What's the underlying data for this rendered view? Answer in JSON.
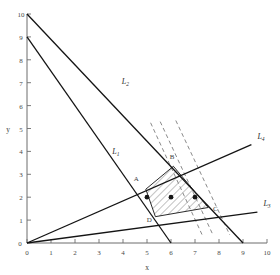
{
  "chart_data": {
    "type": "line",
    "title": "",
    "xlabel": "x",
    "ylabel": "y",
    "xlim": [
      0,
      10
    ],
    "ylim": [
      0,
      10
    ],
    "xticks": [
      0,
      1,
      2,
      3,
      4,
      5,
      6,
      7,
      8,
      9,
      10
    ],
    "yticks": [
      0,
      1,
      2,
      3,
      4,
      5,
      6,
      7,
      8,
      9,
      10
    ],
    "xticklabels": [
      "0",
      "1",
      "2",
      "3",
      "4",
      "5",
      "6",
      "7",
      "8",
      "9",
      "10"
    ],
    "yticklabels": [
      "0",
      "1",
      "2",
      "3",
      "4",
      "5",
      "6",
      "7",
      "8",
      "9",
      "10"
    ],
    "grid": false,
    "legend": "none",
    "series": [
      {
        "name": "L1",
        "label": "L",
        "sub": "1",
        "kind": "solid-constraint-line",
        "points": [
          [
            0,
            9
          ],
          [
            6,
            0
          ]
        ],
        "label_pos": [
          3.55,
          3.9
        ]
      },
      {
        "name": "L2",
        "label": "L",
        "sub": "2",
        "kind": "solid-constraint-line",
        "points": [
          [
            0,
            10
          ],
          [
            9,
            0
          ]
        ],
        "label_pos": [
          3.95,
          6.95
        ]
      },
      {
        "name": "L3",
        "label": "L",
        "sub": "3",
        "kind": "solid-constraint-line",
        "points": [
          [
            0,
            0
          ],
          [
            9.6,
            1.35
          ]
        ],
        "label_pos": [
          9.85,
          1.62
        ]
      },
      {
        "name": "L4",
        "label": "L",
        "sub": "4",
        "kind": "solid-constraint-line",
        "points": [
          [
            0,
            0
          ],
          [
            9.35,
            4.3
          ]
        ],
        "label_pos": [
          9.6,
          4.55
        ]
      }
    ],
    "dashed_objective_lines": [
      {
        "name": "objective-dashed-1",
        "points": [
          [
            5.15,
            5.25
          ],
          [
            7.3,
            0.35
          ]
        ]
      },
      {
        "name": "objective-dashed-2",
        "points": [
          [
            5.55,
            5.3
          ],
          [
            7.75,
            0.35
          ]
        ]
      },
      {
        "name": "objective-dashed-3",
        "points": [
          [
            6.2,
            5.35
          ],
          [
            8.45,
            0.35
          ]
        ]
      }
    ],
    "feasible_region": {
      "name": "feasible-region",
      "hatched": true,
      "vertices": [
        [
          4.95,
          2.35
        ],
        [
          6.1,
          3.35
        ],
        [
          7.55,
          1.55
        ],
        [
          5.35,
          1.15
        ]
      ],
      "vertex_labels": [
        "A",
        "B",
        "C",
        "D"
      ],
      "vertex_label_pos": [
        [
          4.55,
          2.7
        ],
        [
          6.05,
          3.65
        ],
        [
          7.85,
          1.4
        ],
        [
          5.1,
          0.92
        ]
      ]
    },
    "marked_points": [
      {
        "name": "lattice-point-1",
        "x": 5.0,
        "y": 2.0
      },
      {
        "name": "lattice-point-2",
        "x": 6.0,
        "y": 2.0
      },
      {
        "name": "lattice-point-3",
        "x": 7.0,
        "y": 2.0
      }
    ],
    "annotations": []
  },
  "colors": {
    "axis": "#6d6d6d",
    "line": "#141414",
    "dashed": "#8a8a8a",
    "hatch": "#555555",
    "text": "#3c3c3c",
    "background": "#ffffff"
  }
}
